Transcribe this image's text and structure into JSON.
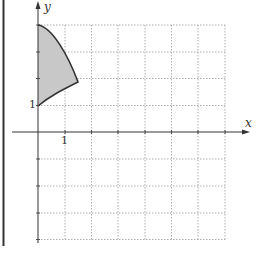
{
  "figure": {
    "axes": {
      "x_label": "x",
      "y_label": "y",
      "x_tick_label": "1",
      "y_tick_label": "1"
    },
    "grid": {
      "style": "dotted",
      "x_range": [
        0,
        6
      ],
      "y_range": [
        -4,
        4
      ],
      "spacing": 1
    },
    "region": {
      "description": "shaded region bounded by a concave-down curve from (0,4) to about (1.5,1.85) and a concave-down curve from (1.5,1.85) back to (0,1)",
      "fill": "#c8c8c8",
      "stroke": "#333333",
      "vertices": [
        [
          0,
          4
        ],
        [
          1.5,
          1.85
        ],
        [
          0,
          1
        ]
      ]
    },
    "colors": {
      "axis": "#333333",
      "grid": "#999999",
      "border": "#333333"
    }
  }
}
